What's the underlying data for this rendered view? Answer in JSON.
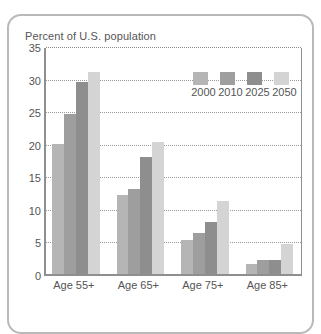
{
  "chart_data": {
    "type": "bar",
    "title": "Percent of U.S. population",
    "xlabel": "",
    "ylabel": "",
    "ylim": [
      0,
      35
    ],
    "yticks": [
      0,
      5,
      10,
      15,
      20,
      25,
      30,
      35
    ],
    "ytick_labels": [
      "0",
      "5",
      "10",
      "15",
      "20",
      "25",
      "30",
      "35"
    ],
    "grid": "horizontal-dotted",
    "legend_position": "upper-right-inside",
    "categories": [
      "Age 55+",
      "Age 65+",
      "Age 75+",
      "Age 85+"
    ],
    "series": [
      {
        "name": "2000",
        "color": "#b5b5b5",
        "values": [
          20.0,
          12.2,
          5.2,
          1.6
        ]
      },
      {
        "name": "2010",
        "color": "#9e9e9e",
        "values": [
          24.5,
          13.0,
          6.3,
          2.1
        ]
      },
      {
        "name": "2025",
        "color": "#8e8e8e",
        "values": [
          29.5,
          18.0,
          8.0,
          2.2
        ]
      },
      {
        "name": "2050",
        "color": "#d4d4d4",
        "values": [
          31.0,
          20.2,
          11.2,
          4.6
        ]
      }
    ]
  },
  "colors": {
    "frame": "#b9b9b9",
    "axis": "#8f8f8f",
    "grid": "#9a9a9a",
    "text": "#555555",
    "background": "#ffffff"
  }
}
